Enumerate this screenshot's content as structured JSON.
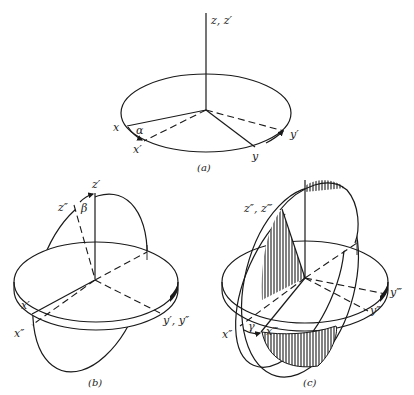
{
  "figure": {
    "colors": {
      "ink": "#1a1a1a",
      "background": "#ffffff"
    },
    "panels": [
      {
        "id": "a",
        "caption": "(a)",
        "labels": {
          "z_axis": "z, z′",
          "x": "x",
          "x_prime": "x′",
          "y": "y",
          "y_prime": "y′",
          "angle": "α"
        }
      },
      {
        "id": "b",
        "caption": "(b)",
        "labels": {
          "z_prime": "z′",
          "z_double": "z″",
          "angle": "β",
          "x_prime": "x′",
          "x_double": "x″",
          "y_axes": "y′, y″"
        }
      },
      {
        "id": "c",
        "caption": "(c)",
        "labels": {
          "z_axes": "z″, z‴",
          "x_double": "x″",
          "x_triple": "x‴",
          "y_double": "y″",
          "y_triple": "y‴",
          "angle": "γ"
        }
      }
    ]
  }
}
